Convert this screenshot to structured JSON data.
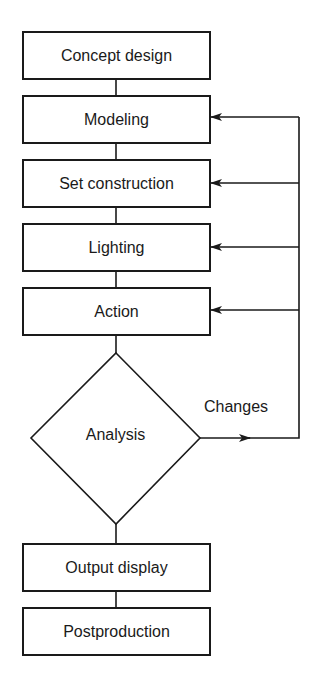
{
  "diagram": {
    "type": "flowchart",
    "nodes": [
      {
        "id": "concept",
        "label": "Concept design",
        "shape": "rect"
      },
      {
        "id": "modeling",
        "label": "Modeling",
        "shape": "rect"
      },
      {
        "id": "set",
        "label": "Set construction",
        "shape": "rect"
      },
      {
        "id": "lighting",
        "label": "Lighting",
        "shape": "rect"
      },
      {
        "id": "action",
        "label": "Action",
        "shape": "rect"
      },
      {
        "id": "analysis",
        "label": "Analysis",
        "shape": "diamond"
      },
      {
        "id": "output",
        "label": "Output display",
        "shape": "rect"
      },
      {
        "id": "post",
        "label": "Postproduction",
        "shape": "rect"
      }
    ],
    "edges": [
      {
        "from": "concept",
        "to": "modeling"
      },
      {
        "from": "modeling",
        "to": "set"
      },
      {
        "from": "set",
        "to": "lighting"
      },
      {
        "from": "lighting",
        "to": "action"
      },
      {
        "from": "action",
        "to": "analysis"
      },
      {
        "from": "analysis",
        "to": "output"
      },
      {
        "from": "output",
        "to": "post"
      },
      {
        "from": "analysis",
        "to": "modeling",
        "label": "Changes"
      },
      {
        "from": "analysis",
        "to": "set",
        "label": "Changes"
      },
      {
        "from": "analysis",
        "to": "lighting",
        "label": "Changes"
      },
      {
        "from": "analysis",
        "to": "action",
        "label": "Changes"
      }
    ],
    "feedback_label": "Changes"
  }
}
